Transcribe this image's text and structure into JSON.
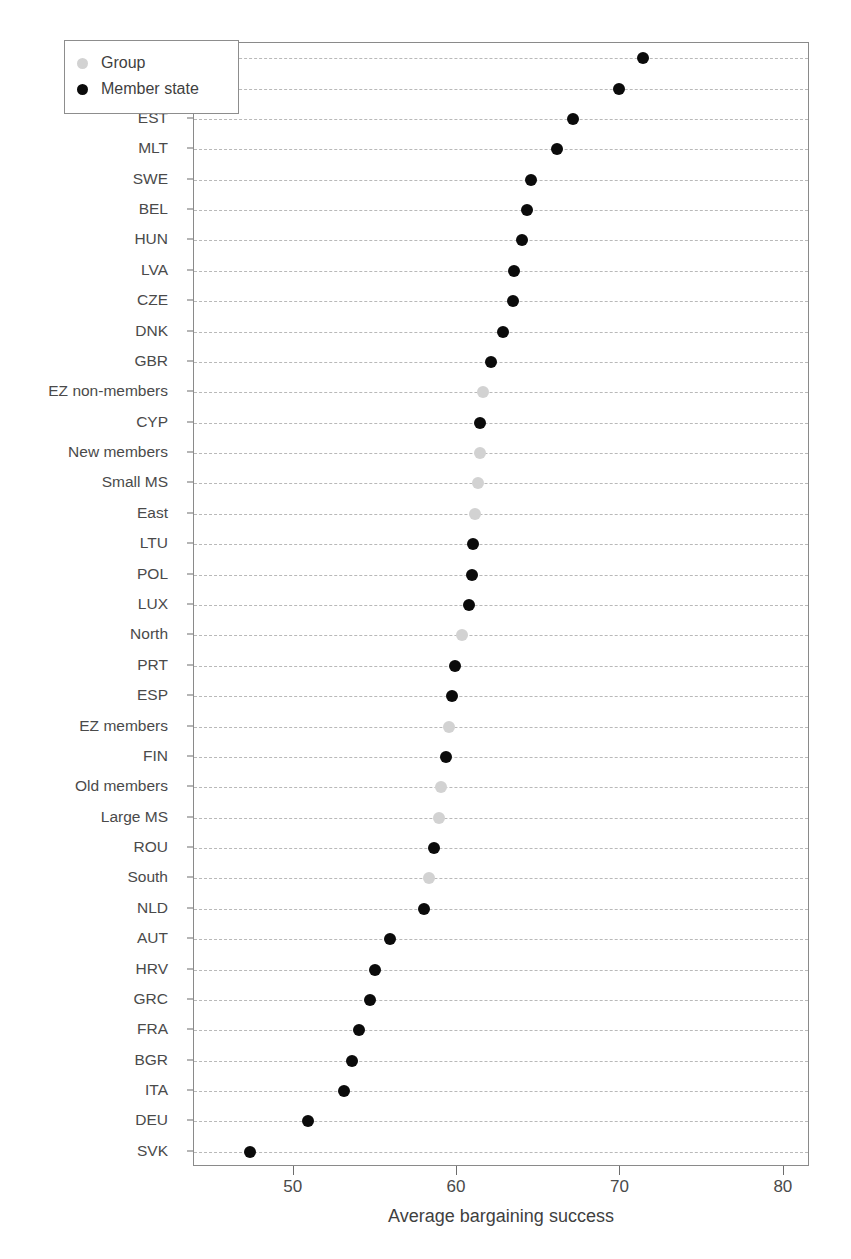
{
  "figure": {
    "top_caption_fragment": "",
    "background_color": "#ffffff"
  },
  "legend": {
    "position": "top-left-inside",
    "entries": [
      {
        "label": "Group",
        "color": "#d2d2d2",
        "marker": "filled-circle"
      },
      {
        "label": "Member state",
        "color": "#0b0b0b",
        "marker": "filled-circle"
      }
    ]
  },
  "axes": {
    "x_title": "Average bargaining success",
    "x_ticks": [
      "50",
      "60",
      "70",
      "80"
    ],
    "x_tick_values": [
      50,
      60,
      70,
      80
    ],
    "y_title": ""
  },
  "chart_data": {
    "type": "scatter",
    "title": "",
    "subtitle": "",
    "xlabel": "Average bargaining success",
    "ylabel": "",
    "xlim": [
      43.9,
      81.6
    ],
    "ylim": [
      0,
      37
    ],
    "grid": "horizontal-dashed",
    "legend_position": "top-left",
    "orientation": "horizontal-dot-plot",
    "series": [
      {
        "name": "Member state",
        "color": "#0b0b0b"
      },
      {
        "name": "Group",
        "color": "#d2d2d2"
      }
    ],
    "categories": [
      "SVN",
      "IRL",
      "EST",
      "MLT",
      "SWE",
      "BEL",
      "HUN",
      "LVA",
      "CZE",
      "DNK",
      "GBR",
      "EZ non-members",
      "CYP",
      "New members",
      "Small MS",
      "East",
      "LTU",
      "POL",
      "LUX",
      "North",
      "PRT",
      "ESP",
      "EZ members",
      "FIN",
      "Old members",
      "Large MS",
      "ROU",
      "South",
      "NLD",
      "AUT",
      "HRV",
      "GRC",
      "FRA",
      "BGR",
      "ITA",
      "DEU",
      "SVK"
    ],
    "points": [
      {
        "label": "SVN",
        "value": 71.4,
        "series": "Member state"
      },
      {
        "label": "IRL",
        "value": 69.9,
        "series": "Member state"
      },
      {
        "label": "EST",
        "value": 67.1,
        "series": "Member state"
      },
      {
        "label": "MLT",
        "value": 66.1,
        "series": "Member state"
      },
      {
        "label": "SWE",
        "value": 64.5,
        "series": "Member state"
      },
      {
        "label": "BEL",
        "value": 64.3,
        "series": "Member state"
      },
      {
        "label": "HUN",
        "value": 64.0,
        "series": "Member state"
      },
      {
        "label": "LVA",
        "value": 63.5,
        "series": "Member state"
      },
      {
        "label": "CZE",
        "value": 63.4,
        "series": "Member state"
      },
      {
        "label": "DNK",
        "value": 62.8,
        "series": "Member state"
      },
      {
        "label": "GBR",
        "value": 62.1,
        "series": "Member state"
      },
      {
        "label": "EZ non-members",
        "value": 61.6,
        "series": "Group"
      },
      {
        "label": "CYP",
        "value": 61.4,
        "series": "Member state"
      },
      {
        "label": "New members",
        "value": 61.4,
        "series": "Group"
      },
      {
        "label": "Small MS",
        "value": 61.3,
        "series": "Group"
      },
      {
        "label": "East",
        "value": 61.1,
        "series": "Group"
      },
      {
        "label": "LTU",
        "value": 61.0,
        "series": "Member state"
      },
      {
        "label": "POL",
        "value": 60.9,
        "series": "Member state"
      },
      {
        "label": "LUX",
        "value": 60.7,
        "series": "Member state"
      },
      {
        "label": "North",
        "value": 60.3,
        "series": "Group"
      },
      {
        "label": "PRT",
        "value": 59.9,
        "series": "Member state"
      },
      {
        "label": "ESP",
        "value": 59.7,
        "series": "Member state"
      },
      {
        "label": "EZ members",
        "value": 59.5,
        "series": "Group"
      },
      {
        "label": "FIN",
        "value": 59.3,
        "series": "Member state"
      },
      {
        "label": "Old members",
        "value": 59.0,
        "series": "Group"
      },
      {
        "label": "Large MS",
        "value": 58.9,
        "series": "Group"
      },
      {
        "label": "ROU",
        "value": 58.6,
        "series": "Member state"
      },
      {
        "label": "South",
        "value": 58.3,
        "series": "Group"
      },
      {
        "label": "NLD",
        "value": 58.0,
        "series": "Member state"
      },
      {
        "label": "AUT",
        "value": 55.9,
        "series": "Member state"
      },
      {
        "label": "HRV",
        "value": 55.0,
        "series": "Member state"
      },
      {
        "label": "GRC",
        "value": 54.7,
        "series": "Member state"
      },
      {
        "label": "FRA",
        "value": 54.0,
        "series": "Member state"
      },
      {
        "label": "BGR",
        "value": 53.6,
        "series": "Member state"
      },
      {
        "label": "ITA",
        "value": 53.1,
        "series": "Member state"
      },
      {
        "label": "DEU",
        "value": 50.9,
        "series": "Member state"
      },
      {
        "label": "SVK",
        "value": 47.3,
        "series": "Member state"
      }
    ]
  }
}
